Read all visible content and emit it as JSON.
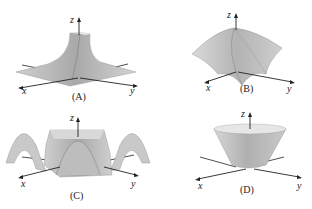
{
  "figure": {
    "panels": [
      {
        "id": "A",
        "caption": "(A)",
        "axes": {
          "x": "x",
          "y": "y",
          "z": "z"
        },
        "surface": "peak-with-concave-sides"
      },
      {
        "id": "B",
        "caption": "(B)",
        "axes": {
          "x": "x",
          "y": "y",
          "z": "z"
        },
        "surface": "saddle-ridges"
      },
      {
        "id": "C",
        "caption": "(C)",
        "axes": {
          "x": "x",
          "y": "y",
          "z": "z"
        },
        "surface": "oscillating-waves"
      },
      {
        "id": "D",
        "caption": "(D)",
        "axes": {
          "x": "x",
          "y": "y",
          "z": "z"
        },
        "surface": "inverted-cone"
      }
    ],
    "colors": {
      "surface_light": "#d8d8d8",
      "surface_mid": "#bdbdbd",
      "surface_dark": "#9a9a9a",
      "axis": "#222222"
    }
  }
}
